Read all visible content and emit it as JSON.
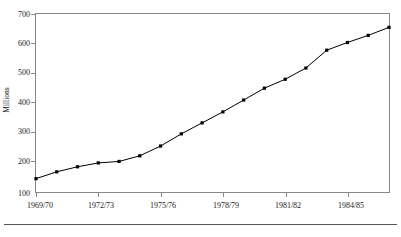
{
  "chart_data": {
    "type": "line",
    "title": "",
    "xlabel": "",
    "ylabel": "Millions",
    "ylim": [
      100,
      700
    ],
    "yticks": [
      100,
      200,
      300,
      400,
      500,
      600,
      700
    ],
    "ytick_labels": [
      "100",
      "200",
      "300",
      "400",
      "500",
      "600",
      "700"
    ],
    "grid": false,
    "legend": "none",
    "x": [
      "1969/70",
      "1970/71",
      "1971/72",
      "1972/73",
      "1973/74",
      "1974/75",
      "1975/76",
      "1976/77",
      "1977/78",
      "1978/79",
      "1979/80",
      "1980/81",
      "1981/82",
      "1982/83",
      "1983/84",
      "1984/85",
      "1985/86",
      "1986/87"
    ],
    "xtick_labels": [
      "1969/70",
      "1972/73",
      "1975/76",
      "1978/79",
      "1981/82",
      "1984/85"
    ],
    "xtick_indices": [
      0,
      3,
      6,
      9,
      12,
      15
    ],
    "series": [
      {
        "name": "Millions",
        "values": [
          145,
          168,
          185,
          198,
          203,
          222,
          255,
          296,
          333,
          370,
          410,
          450,
          480,
          518,
          578,
          604,
          628,
          655
        ]
      }
    ],
    "marker": "filled-square",
    "line_color": "#000000"
  },
  "figure": {
    "axis_color": "#888888",
    "footer_rule_color": "#555555"
  }
}
